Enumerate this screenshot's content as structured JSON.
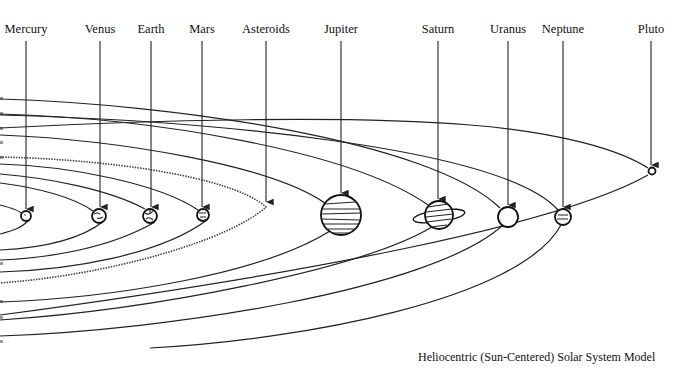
{
  "diagram": {
    "caption": "Heliocentric (Sun-Centered) Solar System Model",
    "labels": [
      {
        "name": "Mercury",
        "x": 26
      },
      {
        "name": "Venus",
        "x": 100
      },
      {
        "name": "Earth",
        "x": 151
      },
      {
        "name": "Mars",
        "x": 202
      },
      {
        "name": "Asteroids",
        "x": 266
      },
      {
        "name": "Jupiter",
        "x": 341
      },
      {
        "name": "Saturn",
        "x": 438
      },
      {
        "name": "Uranus",
        "x": 508
      },
      {
        "name": "Neptune",
        "x": 563
      },
      {
        "name": "Pluto",
        "x": 651
      }
    ],
    "bodies": [
      {
        "name": "Mercury",
        "cx": 26,
        "cy": 216,
        "r": 5
      },
      {
        "name": "Venus",
        "cx": 99,
        "cy": 216,
        "r": 7
      },
      {
        "name": "Earth",
        "cx": 150,
        "cy": 216,
        "r": 7
      },
      {
        "name": "Mars",
        "cx": 203,
        "cy": 215,
        "r": 6
      },
      {
        "name": "Jupiter",
        "cx": 341,
        "cy": 215,
        "r": 20
      },
      {
        "name": "Saturn",
        "cx": 439,
        "cy": 215,
        "r": 14,
        "ring": true
      },
      {
        "name": "Uranus",
        "cx": 508,
        "cy": 217,
        "r": 10
      },
      {
        "name": "Neptune",
        "cx": 563,
        "cy": 217,
        "r": 8
      },
      {
        "name": "Pluto",
        "cx": 652,
        "cy": 171,
        "r": 4
      }
    ],
    "asteroid_belt": {
      "name": "Asteroids",
      "apex_x": 266,
      "apex_y": 207
    }
  }
}
